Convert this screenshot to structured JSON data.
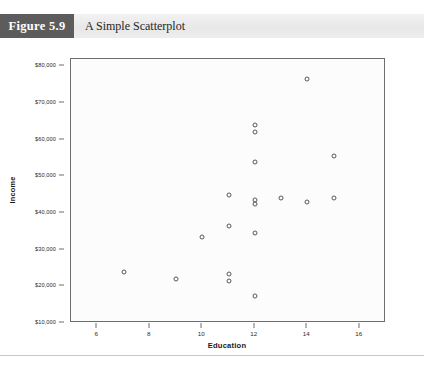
{
  "header": {
    "figure_number": "Figure 5.9",
    "title": "A Simple Scatterplot",
    "number_box_color": "#5c5c5c",
    "banner_color": "#ededed"
  },
  "chart_data": {
    "type": "scatter",
    "title": "A Simple Scatterplot",
    "xlabel": "Education",
    "ylabel": "Income",
    "xlim": [
      5,
      17
    ],
    "ylim": [
      10000,
      82000
    ],
    "xticks": [
      6,
      8,
      10,
      12,
      14,
      16
    ],
    "xtick_labels": [
      "6",
      "8",
      "10",
      "12",
      "14",
      "16"
    ],
    "yticks": [
      10000,
      20000,
      30000,
      40000,
      50000,
      60000,
      70000,
      80000
    ],
    "ytick_labels": [
      "$10,000",
      "$20,000",
      "$30,000",
      "$40,000",
      "$50,000",
      "$60,000",
      "$70,000",
      "$80,000"
    ],
    "grid": false,
    "legend": false,
    "marker": "open-circle",
    "marker_color": "#58585a",
    "points": [
      {
        "x": 7,
        "y": 24000
      },
      {
        "x": 9,
        "y": 22000
      },
      {
        "x": 10,
        "y": 33500
      },
      {
        "x": 11,
        "y": 45000
      },
      {
        "x": 11,
        "y": 36500
      },
      {
        "x": 11,
        "y": 23500
      },
      {
        "x": 11,
        "y": 21500
      },
      {
        "x": 12,
        "y": 64000
      },
      {
        "x": 12,
        "y": 62000
      },
      {
        "x": 12,
        "y": 54000
      },
      {
        "x": 12,
        "y": 43500
      },
      {
        "x": 12,
        "y": 42500
      },
      {
        "x": 12,
        "y": 34500
      },
      {
        "x": 12,
        "y": 17500
      },
      {
        "x": 13,
        "y": 44000
      },
      {
        "x": 14,
        "y": 76500
      },
      {
        "x": 14,
        "y": 43000
      },
      {
        "x": 15,
        "y": 55500
      },
      {
        "x": 15,
        "y": 44000
      }
    ]
  }
}
